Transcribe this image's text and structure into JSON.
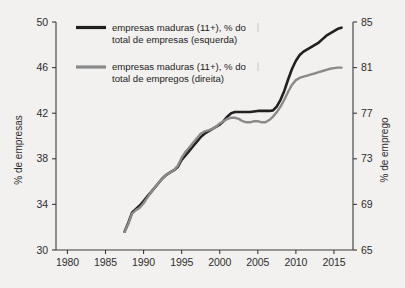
{
  "chart_data": {
    "type": "line",
    "title": "",
    "subtitle": "",
    "xlabel": "",
    "ylabel": "% de empresas",
    "y2label": "% de emprego",
    "xlim": [
      1978.5,
      2017.5
    ],
    "ylim": [
      30,
      50
    ],
    "y2lim": [
      65,
      85
    ],
    "xticks": [
      "1980",
      "1985",
      "1990",
      "1995",
      "2000",
      "2005",
      "2010",
      "2015"
    ],
    "xtick_values": [
      1980,
      1985,
      1990,
      1995,
      2000,
      2005,
      2010,
      2015
    ],
    "yticks": [
      "30",
      "34",
      "38",
      "42",
      "46",
      "50"
    ],
    "ytick_values": [
      30,
      34,
      38,
      42,
      46,
      50
    ],
    "y2ticks": [
      "65",
      "69",
      "73",
      "77",
      "81",
      "85"
    ],
    "y2tick_values": [
      65,
      69,
      73,
      77,
      81,
      85
    ],
    "grid": false,
    "legend_position": "top-left",
    "colors": {
      "series1": "#231f20",
      "series2": "#8a8a8a",
      "axis": "#3a3a3a",
      "background": "#f2f1ef",
      "text": "#1c1c1c"
    },
    "series": [
      {
        "name": "empresas maduras (11+), % do total de empresas (esquerda)",
        "axis": "left",
        "color": "#231f20",
        "x": [
          1987.5,
          1988,
          1988.5,
          1989,
          1989.5,
          1990,
          1990.5,
          1991,
          1991.5,
          1992,
          1992.5,
          1993,
          1993.5,
          1994,
          1994.5,
          1995,
          1995.5,
          1996,
          1996.5,
          1997,
          1997.5,
          1998,
          1998.5,
          1999,
          1999.5,
          2000,
          2000.5,
          2001,
          2001.5,
          2002,
          2002.5,
          2003,
          2003.5,
          2004,
          2004.5,
          2005,
          2005.5,
          2006,
          2006.5,
          2007,
          2007.5,
          2008,
          2008.5,
          2009,
          2009.5,
          2010,
          2010.5,
          2011,
          2011.5,
          2012,
          2012.5,
          2013,
          2013.5,
          2014,
          2014.5,
          2015,
          2015.5,
          2016
        ],
        "y": [
          31.6,
          32.4,
          33.3,
          33.6,
          33.9,
          34.3,
          34.7,
          35.1,
          35.5,
          35.9,
          36.3,
          36.6,
          36.8,
          37.0,
          37.3,
          37.9,
          38.3,
          38.7,
          39.1,
          39.5,
          39.9,
          40.2,
          40.4,
          40.6,
          40.8,
          41.0,
          41.3,
          41.7,
          42.0,
          42.1,
          42.1,
          42.1,
          42.1,
          42.1,
          42.15,
          42.2,
          42.2,
          42.2,
          42.2,
          42.25,
          42.6,
          43.2,
          44.0,
          45.0,
          45.9,
          46.6,
          47.1,
          47.4,
          47.6,
          47.8,
          48.0,
          48.2,
          48.5,
          48.8,
          49.0,
          49.2,
          49.4,
          49.5
        ]
      },
      {
        "name": "empresas maduras (11+), % do total de empregos (direita)",
        "axis": "right",
        "color": "#8a8a8a",
        "x": [
          1987.5,
          1988,
          1988.5,
          1989,
          1989.5,
          1990,
          1990.5,
          1991,
          1991.5,
          1992,
          1992.5,
          1993,
          1993.5,
          1994,
          1994.5,
          1995,
          1995.5,
          1996,
          1996.5,
          1997,
          1997.5,
          1998,
          1998.5,
          1999,
          1999.5,
          2000,
          2000.5,
          2001,
          2001.5,
          2002,
          2002.5,
          2003,
          2003.5,
          2004,
          2004.5,
          2005,
          2005.5,
          2006,
          2006.5,
          2007,
          2007.5,
          2008,
          2008.5,
          2009,
          2009.5,
          2010,
          2010.5,
          2011,
          2011.5,
          2012,
          2012.5,
          2013,
          2013.5,
          2014,
          2014.5,
          2015,
          2015.5,
          2016
        ],
        "y": [
          66.6,
          67.3,
          68.2,
          68.5,
          68.7,
          69.1,
          69.6,
          70.1,
          70.5,
          70.9,
          71.3,
          71.6,
          71.8,
          72.0,
          72.4,
          73.1,
          73.6,
          74.0,
          74.4,
          74.8,
          75.2,
          75.4,
          75.5,
          75.6,
          75.8,
          76.1,
          76.3,
          76.5,
          76.6,
          76.6,
          76.5,
          76.3,
          76.2,
          76.2,
          76.3,
          76.3,
          76.2,
          76.2,
          76.4,
          76.7,
          77.1,
          77.6,
          78.2,
          78.9,
          79.5,
          79.9,
          80.1,
          80.2,
          80.3,
          80.4,
          80.5,
          80.6,
          80.7,
          80.8,
          80.9,
          80.95,
          81.0,
          81.0
        ]
      }
    ],
    "legend_entries": [
      {
        "line1": "empresas maduras (11+), % do",
        "line2": "total de empresas (esquerda)",
        "color": "#231f20"
      },
      {
        "line1": "empresas maduras (11+), % do",
        "line2": "total de empregos (direita)",
        "color": "#8a8a8a"
      }
    ]
  }
}
